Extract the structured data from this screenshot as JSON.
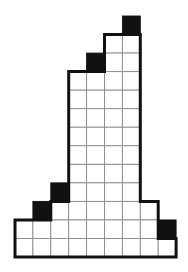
{
  "figure": {
    "type": "grid-polyomino",
    "columns": 9,
    "rows": 13,
    "origin": {
      "x": 15,
      "y": 16
    },
    "cell_width": 17.9,
    "cell_height": 18.54,
    "colors": {
      "shaded": "#111111",
      "empty": "#ffffff",
      "grid_line": "#8a8a8a",
      "outline": "#111111"
    },
    "rows_layout": [
      {
        "row": 0,
        "white": [],
        "black": [
          6
        ]
      },
      {
        "row": 1,
        "white": [
          5,
          6
        ],
        "black": []
      },
      {
        "row": 2,
        "white": [
          5,
          6
        ],
        "black": [
          4
        ]
      },
      {
        "row": 3,
        "white": [
          3,
          4,
          5,
          6
        ],
        "black": []
      },
      {
        "row": 4,
        "white": [
          3,
          4,
          5,
          6
        ],
        "black": []
      },
      {
        "row": 5,
        "white": [
          3,
          4,
          5,
          6
        ],
        "black": []
      },
      {
        "row": 6,
        "white": [
          3,
          4,
          5,
          6
        ],
        "black": []
      },
      {
        "row": 7,
        "white": [
          3,
          4,
          5,
          6
        ],
        "black": []
      },
      {
        "row": 8,
        "white": [
          3,
          4,
          5,
          6
        ],
        "black": []
      },
      {
        "row": 9,
        "white": [
          3,
          4,
          5,
          6
        ],
        "black": [
          2
        ]
      },
      {
        "row": 10,
        "white": [
          2,
          3,
          4,
          5,
          6,
          7
        ],
        "black": [
          1
        ]
      },
      {
        "row": 11,
        "white": [
          0,
          1,
          2,
          3,
          4,
          5,
          6,
          7
        ],
        "black": [
          8
        ]
      },
      {
        "row": 12,
        "white": [
          0,
          1,
          2,
          3,
          4,
          5,
          6,
          7,
          8
        ],
        "black": []
      }
    ],
    "shaded_cell_count": 5,
    "white_cell_count": 54
  }
}
